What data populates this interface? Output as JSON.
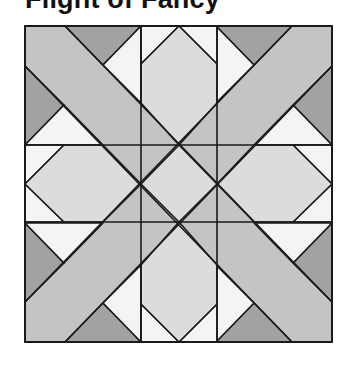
{
  "title": "Flight of Fancy",
  "colors": {
    "band": "#c4c4c4",
    "dark": "#a2a2a2",
    "light": "#dcdcdc",
    "white": "#f4f4f4",
    "line": "#1a1a1a"
  },
  "block": {
    "x_grid": [
      25,
      141,
      217,
      332
    ],
    "y_grid": [
      26,
      145,
      222,
      342
    ]
  }
}
